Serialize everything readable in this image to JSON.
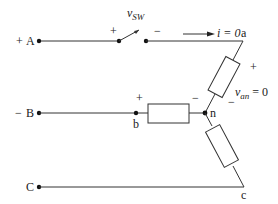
{
  "diagram": {
    "title": "",
    "terminals": [
      {
        "id": "A",
        "label": "A",
        "polarity": "+"
      },
      {
        "id": "B",
        "label": "B",
        "polarity": "−"
      },
      {
        "id": "C",
        "label": "C",
        "polarity": ""
      }
    ],
    "nodes": {
      "a": "a",
      "b": "b",
      "c": "c",
      "n": "n"
    },
    "switch": {
      "voltage_label": "v",
      "voltage_sub": "SW",
      "plus": "+",
      "minus": "−"
    },
    "current": {
      "label": "i = 0"
    },
    "resistor_an": {
      "voltage_label": "v",
      "voltage_sub": "an",
      "voltage_value": " = 0",
      "plus": "+",
      "minus": "−"
    },
    "resistor_bn": {
      "plus": "+",
      "minus": "−"
    },
    "resistor_cn": {}
  }
}
